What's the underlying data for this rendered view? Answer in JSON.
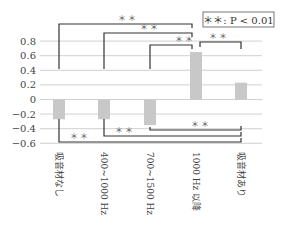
{
  "chart_data": {
    "type": "bar",
    "title": "",
    "xlabel": "",
    "ylabel": "",
    "categories": [
      "吸音材なし",
      "400~1000 Hz",
      "700~1500 Hz",
      "1000 Hz 以降",
      "吸音材あり"
    ],
    "values": [
      -0.27,
      -0.27,
      -0.35,
      0.65,
      0.23
    ],
    "ylim": [
      -0.6,
      0.8
    ],
    "yticks": [
      0.8,
      0.6,
      0.4,
      0.2,
      0,
      -0.2,
      -0.4,
      -0.6
    ],
    "ytick_labels": [
      "0.8",
      "0.6",
      "0.4",
      "0.2",
      "0",
      "−0.2",
      "−0.4",
      "−0.6"
    ],
    "grid": true,
    "bar_color": "#c8c8c8",
    "legend": {
      "text": "＊＊: P < 0.01",
      "position": "top-right"
    },
    "significance": [
      {
        "from": "吸音材なし",
        "to": "1000 Hz 以降",
        "label": "＊＊",
        "side": "top"
      },
      {
        "from": "400~1000 Hz",
        "to": "1000 Hz 以降",
        "label": "＊＊",
        "side": "top"
      },
      {
        "from": "700~1500 Hz",
        "to": "1000 Hz 以降",
        "label": "＊＊",
        "side": "top"
      },
      {
        "from": "1000 Hz 以降",
        "to": "吸音材あり",
        "label": "＊＊",
        "side": "top"
      },
      {
        "from": "吸音材なし",
        "to": "吸音材あり",
        "label": "＊＊",
        "side": "bottom"
      },
      {
        "from": "400~1000 Hz",
        "to": "吸音材あり",
        "label": "＊＊",
        "side": "bottom"
      },
      {
        "from": "700~1500 Hz",
        "to": "吸音材あり",
        "label": "＊＊",
        "side": "bottom"
      }
    ]
  },
  "legend_label": "＊＊: P < 0.01",
  "sig_label": "＊＊"
}
